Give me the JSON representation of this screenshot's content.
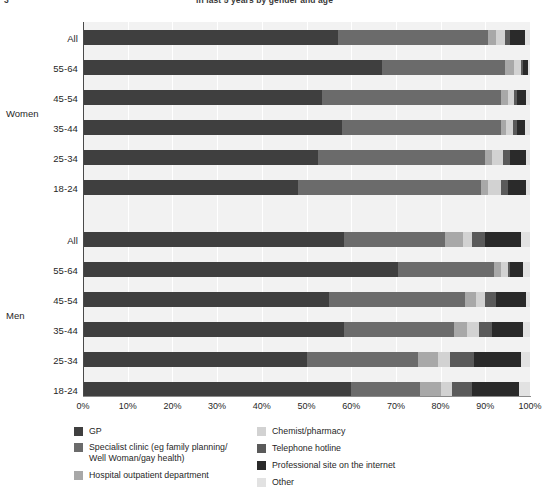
{
  "figure": {
    "number": "3",
    "title": "in last 5 years by gender and age",
    "clipped": true
  },
  "axis": {
    "x_ticks": [
      "0%",
      "10%",
      "20%",
      "30%",
      "40%",
      "50%",
      "60%",
      "70%",
      "80%",
      "90%",
      "100%"
    ],
    "x_min": 0,
    "x_max": 100
  },
  "groups": [
    {
      "name": "Women"
    },
    {
      "name": "Men"
    }
  ],
  "legend": {
    "items": [
      {
        "label": "GP",
        "color": "#3f3f3f"
      },
      {
        "label": "Specialist clinic (eg family planning/\nWell Woman/gay health)",
        "color": "#6b6b6b"
      },
      {
        "label": "Hospital outpatient department",
        "color": "#a8a8a8"
      },
      {
        "label": "Chemist/pharmacy",
        "color": "#d2d2d2"
      },
      {
        "label": "Telephone  hotline",
        "color": "#5a5a5a"
      },
      {
        "label": "Professional site on the internet",
        "color": "#2a2a2a"
      },
      {
        "label": "Other",
        "color": "#e2e2e2"
      }
    ]
  },
  "chart_data": {
    "type": "bar",
    "subtype": "stacked-horizontal-100pct",
    "title": "in last 5 years by gender and age",
    "xlabel": "",
    "ylabel": "",
    "xlim": [
      0,
      100
    ],
    "grid": true,
    "legend_position": "bottom",
    "categories": [
      "GP",
      "Specialist clinic (eg family planning/Well Woman/gay health)",
      "Hospital outpatient department",
      "Chemist/pharmacy",
      "Telephone hotline",
      "Professional site on the internet",
      "Other"
    ],
    "category_colors": [
      "#3f3f3f",
      "#6b6b6b",
      "#a8a8a8",
      "#d2d2d2",
      "#5a5a5a",
      "#2a2a2a",
      "#e2e2e2"
    ],
    "group_order": [
      "Women",
      "Men"
    ],
    "rows": [
      {
        "group": "Women",
        "age": "All",
        "values": [
          57.0,
          33.5,
          1.8,
          2.2,
          1.0,
          3.5,
          1.0
        ]
      },
      {
        "group": "Women",
        "age": "55-64",
        "values": [
          67.0,
          27.5,
          2.0,
          1.5,
          0.5,
          1.0,
          0.5
        ]
      },
      {
        "group": "Women",
        "age": "45-54",
        "values": [
          53.5,
          40.0,
          1.5,
          1.5,
          0.5,
          2.0,
          1.0
        ]
      },
      {
        "group": "Women",
        "age": "35-44",
        "values": [
          58.0,
          35.5,
          1.2,
          1.5,
          0.8,
          2.0,
          1.0
        ]
      },
      {
        "group": "Women",
        "age": "25-34",
        "values": [
          52.5,
          37.5,
          1.5,
          2.5,
          1.5,
          3.5,
          1.0
        ]
      },
      {
        "group": "Women",
        "age": "18-24",
        "values": [
          48.0,
          41.0,
          1.5,
          3.0,
          1.5,
          4.0,
          1.0
        ]
      },
      {
        "group": "Men",
        "age": "All",
        "values": [
          58.5,
          22.5,
          4.0,
          2.0,
          3.0,
          8.0,
          2.0
        ]
      },
      {
        "group": "Men",
        "age": "55-64",
        "values": [
          70.5,
          21.5,
          1.5,
          1.5,
          0.5,
          3.0,
          1.5
        ]
      },
      {
        "group": "Men",
        "age": "45-54",
        "values": [
          55.0,
          30.5,
          2.5,
          2.0,
          2.5,
          6.5,
          1.0
        ]
      },
      {
        "group": "Men",
        "age": "35-44",
        "values": [
          58.5,
          24.5,
          3.0,
          2.5,
          3.0,
          7.0,
          1.5
        ]
      },
      {
        "group": "Men",
        "age": "25-34",
        "values": [
          50.0,
          25.0,
          4.5,
          2.5,
          5.5,
          10.5,
          2.0
        ]
      },
      {
        "group": "Men",
        "age": "18-24",
        "values": [
          60.0,
          15.5,
          4.5,
          2.5,
          4.5,
          10.5,
          2.5
        ]
      }
    ]
  }
}
